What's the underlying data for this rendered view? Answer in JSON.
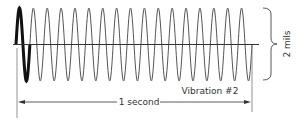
{
  "diagram": {
    "type": "sine-wave-vibration",
    "title": "Vibration #2",
    "cycles": 17,
    "highlighted_cycle": 1,
    "period_label": "1 second",
    "amplitude_label": "2 mils",
    "colors": {
      "wave": "#555555",
      "highlight": "#111111",
      "axis": "#333333",
      "text": "#333333"
    }
  },
  "chart_data": {
    "type": "line",
    "title": "Vibration #2",
    "xlabel": "1 second",
    "ylabel": "2 mils",
    "frequency_cycles_per_second": 17,
    "peak_to_peak_amplitude_mils": 2,
    "highlighted_cycles": [
      1
    ]
  }
}
